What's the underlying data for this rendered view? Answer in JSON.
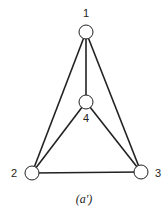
{
  "diagram": {
    "type": "graph",
    "caption": "(a′)",
    "nodes": [
      {
        "id": "1",
        "label": "1",
        "cx": 86,
        "cy": 32,
        "lx": 86,
        "ly": 17
      },
      {
        "id": "4",
        "label": "4",
        "cx": 86,
        "cy": 102,
        "lx": 86,
        "ly": 122
      },
      {
        "id": "2",
        "label": "2",
        "cx": 32,
        "cy": 173,
        "lx": 14,
        "ly": 177
      },
      {
        "id": "3",
        "label": "3",
        "cx": 141,
        "cy": 172,
        "lx": 158,
        "ly": 177
      }
    ],
    "edges": [
      [
        "1",
        "2"
      ],
      [
        "1",
        "3"
      ],
      [
        "1",
        "4"
      ],
      [
        "4",
        "2"
      ],
      [
        "4",
        "3"
      ],
      [
        "2",
        "3"
      ]
    ],
    "node_radius": 7,
    "colors": {
      "stroke": "#222222",
      "fill": "#ffffff"
    }
  }
}
